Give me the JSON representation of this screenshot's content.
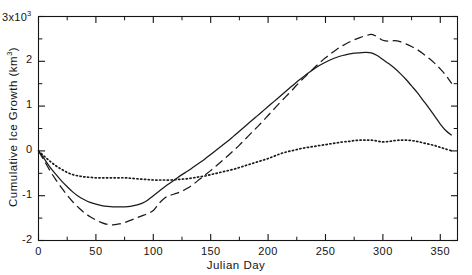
{
  "chart_data": {
    "type": "line",
    "title": "",
    "xlabel": "Julian Day",
    "ylabel": "Cumulative Ice Growth (km",
    "ylabel_sup": "3",
    "ylabel_close": ")",
    "y_exponent_label": "3x10",
    "y_exponent_sup": "3",
    "xlim": [
      0,
      365
    ],
    "ylim": [
      -2,
      3
    ],
    "grid": false,
    "legend": false,
    "x_ticks_major": [
      0,
      50,
      100,
      150,
      200,
      250,
      300,
      350
    ],
    "x_tick_labels": [
      "0",
      "50",
      "100",
      "150",
      "200",
      "250",
      "300",
      "350"
    ],
    "x_ticks_minor": [
      25,
      75,
      125,
      175,
      225,
      275,
      325
    ],
    "y_ticks_major": [
      -2,
      -1,
      0,
      1,
      2,
      3
    ],
    "y_tick_labels": [
      "-2",
      "-1",
      "0",
      "1",
      "2",
      "3x10"
    ],
    "y_ticks_minor": [
      -1.5,
      -0.5,
      0.5,
      1.5,
      2.5
    ],
    "y_units": "km^3",
    "y_scale_note": "values in thousands of km^3",
    "series": [
      {
        "name": "solid-curve",
        "style": "solid",
        "color": "#1a1a1a",
        "x": [
          0,
          5,
          10,
          15,
          20,
          25,
          30,
          35,
          40,
          45,
          50,
          55,
          60,
          65,
          70,
          75,
          80,
          85,
          90,
          95,
          100,
          105,
          110,
          115,
          120,
          125,
          130,
          135,
          140,
          145,
          150,
          155,
          160,
          165,
          170,
          175,
          180,
          185,
          190,
          195,
          200,
          205,
          210,
          215,
          220,
          225,
          230,
          235,
          240,
          245,
          250,
          255,
          260,
          265,
          270,
          275,
          280,
          285,
          290,
          295,
          300,
          305,
          310,
          315,
          320,
          325,
          330,
          335,
          340,
          345,
          350,
          355,
          360
        ],
        "y": [
          0.0,
          -0.18,
          -0.36,
          -0.52,
          -0.67,
          -0.8,
          -0.92,
          -1.02,
          -1.09,
          -1.15,
          -1.19,
          -1.22,
          -1.24,
          -1.25,
          -1.25,
          -1.25,
          -1.24,
          -1.21,
          -1.17,
          -1.1,
          -1.0,
          -0.9,
          -0.8,
          -0.71,
          -0.62,
          -0.53,
          -0.45,
          -0.36,
          -0.27,
          -0.18,
          -0.08,
          0.02,
          0.12,
          0.22,
          0.33,
          0.44,
          0.55,
          0.66,
          0.77,
          0.88,
          0.99,
          1.1,
          1.21,
          1.32,
          1.43,
          1.54,
          1.64,
          1.74,
          1.83,
          1.91,
          1.98,
          2.04,
          2.09,
          2.13,
          2.16,
          2.18,
          2.19,
          2.2,
          2.19,
          2.13,
          2.04,
          1.95,
          1.85,
          1.73,
          1.6,
          1.45,
          1.3,
          1.13,
          0.96,
          0.78,
          0.6,
          0.45,
          0.35
        ]
      },
      {
        "name": "dashed-curve",
        "style": "dashed",
        "color": "#1a1a1a",
        "x": [
          0,
          5,
          10,
          15,
          20,
          25,
          30,
          35,
          40,
          45,
          50,
          55,
          60,
          65,
          70,
          75,
          80,
          85,
          90,
          95,
          100,
          105,
          110,
          115,
          120,
          125,
          130,
          135,
          140,
          145,
          150,
          155,
          160,
          165,
          170,
          175,
          180,
          185,
          190,
          195,
          200,
          205,
          210,
          215,
          220,
          225,
          230,
          235,
          240,
          245,
          250,
          255,
          260,
          265,
          270,
          275,
          280,
          285,
          290,
          295,
          300,
          305,
          310,
          315,
          320,
          325,
          330,
          335,
          340,
          345,
          350,
          355,
          360
        ],
        "y": [
          0.0,
          -0.22,
          -0.44,
          -0.64,
          -0.82,
          -0.99,
          -1.14,
          -1.27,
          -1.38,
          -1.47,
          -1.54,
          -1.6,
          -1.64,
          -1.65,
          -1.63,
          -1.6,
          -1.55,
          -1.5,
          -1.45,
          -1.4,
          -1.33,
          -1.17,
          -1.05,
          -0.99,
          -0.95,
          -0.9,
          -0.83,
          -0.74,
          -0.64,
          -0.54,
          -0.44,
          -0.33,
          -0.22,
          -0.11,
          0.01,
          0.13,
          0.26,
          0.39,
          0.52,
          0.65,
          0.79,
          0.93,
          1.07,
          1.2,
          1.33,
          1.47,
          1.6,
          1.73,
          1.85,
          1.97,
          2.08,
          2.18,
          2.27,
          2.35,
          2.42,
          2.48,
          2.53,
          2.57,
          2.6,
          2.55,
          2.47,
          2.45,
          2.46,
          2.44,
          2.39,
          2.33,
          2.26,
          2.17,
          2.07,
          1.96,
          1.83,
          1.68,
          1.5
        ]
      },
      {
        "name": "dotted-curve",
        "style": "dotted",
        "color": "#1a1a1a",
        "x": [
          0,
          5,
          10,
          15,
          20,
          25,
          30,
          35,
          40,
          45,
          50,
          55,
          60,
          65,
          70,
          75,
          80,
          85,
          90,
          95,
          100,
          105,
          110,
          115,
          120,
          125,
          130,
          135,
          140,
          145,
          150,
          155,
          160,
          165,
          170,
          175,
          180,
          185,
          190,
          195,
          200,
          205,
          210,
          215,
          220,
          225,
          230,
          235,
          240,
          245,
          250,
          255,
          260,
          265,
          270,
          275,
          280,
          285,
          290,
          295,
          300,
          305,
          310,
          315,
          320,
          325,
          330,
          335,
          340,
          345,
          350,
          355,
          360
        ],
        "y": [
          0.0,
          -0.12,
          -0.23,
          -0.33,
          -0.41,
          -0.48,
          -0.53,
          -0.56,
          -0.58,
          -0.59,
          -0.6,
          -0.6,
          -0.6,
          -0.6,
          -0.6,
          -0.6,
          -0.61,
          -0.62,
          -0.63,
          -0.64,
          -0.65,
          -0.65,
          -0.65,
          -0.65,
          -0.64,
          -0.63,
          -0.62,
          -0.6,
          -0.58,
          -0.56,
          -0.53,
          -0.5,
          -0.47,
          -0.44,
          -0.41,
          -0.37,
          -0.33,
          -0.29,
          -0.25,
          -0.21,
          -0.17,
          -0.12,
          -0.07,
          -0.03,
          0.0,
          0.03,
          0.06,
          0.08,
          0.1,
          0.12,
          0.14,
          0.16,
          0.18,
          0.2,
          0.21,
          0.23,
          0.24,
          0.24,
          0.24,
          0.22,
          0.2,
          0.21,
          0.23,
          0.24,
          0.24,
          0.23,
          0.21,
          0.18,
          0.15,
          0.12,
          0.08,
          0.04,
          0.0
        ]
      }
    ]
  }
}
